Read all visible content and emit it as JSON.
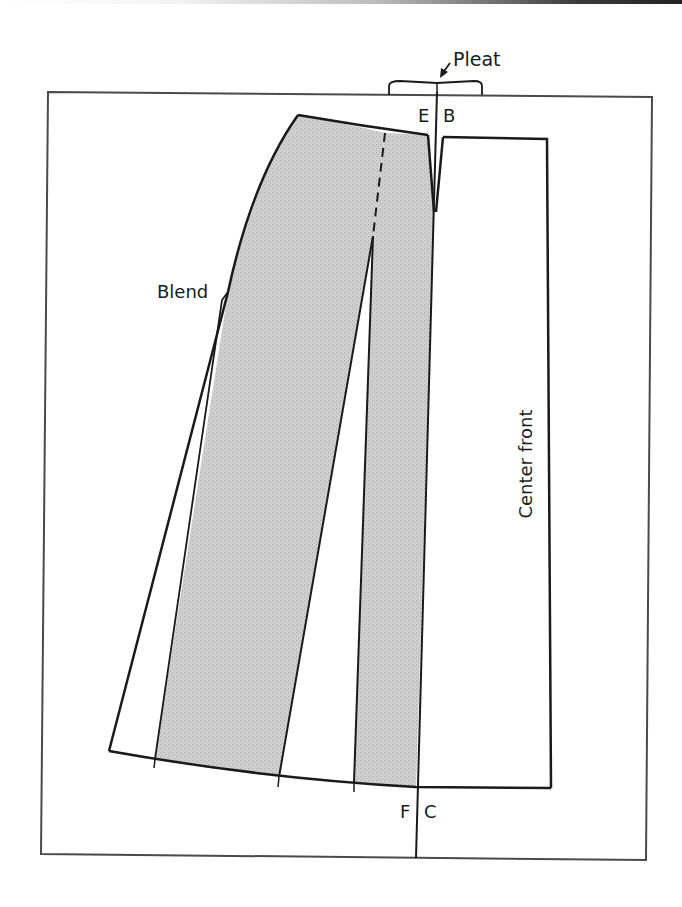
{
  "figure": {
    "type": "pattern-drafting-diagram",
    "labels": {
      "pleat": "Pleat",
      "point_e": "E",
      "point_b": "B",
      "blend": "Blend",
      "center_front": "Center front",
      "point_f": "F",
      "point_c": "C"
    },
    "colors": {
      "line": "#1a1a1a",
      "shading": "#c9c9c9",
      "frame": "#4a4a4a",
      "background": "#ffffff"
    },
    "line_styles": {
      "seam_guide": "dashed",
      "outline": "solid"
    }
  }
}
